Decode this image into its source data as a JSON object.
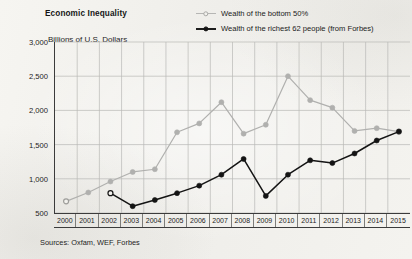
{
  "chart_data": {
    "type": "line",
    "title": "Economic Inequality",
    "subtitle": "",
    "ylabel": "Billions of U.S. Dollars",
    "xlabel": "",
    "ylim": [
      500,
      3000
    ],
    "ytick_step": 500,
    "ytick_labels": [
      "3,000",
      "2,500",
      "2,000",
      "1,500",
      "1,000",
      "500"
    ],
    "ytick_values": [
      3000,
      2500,
      2000,
      1500,
      1000,
      500
    ],
    "grid": true,
    "legend_position": "top-right",
    "categories": [
      "2000",
      "2001",
      "2002",
      "2003",
      "2004",
      "2005",
      "2006",
      "2007",
      "2008",
      "2009",
      "2010",
      "2011",
      "2012",
      "2013",
      "2014",
      "2015"
    ],
    "x": [
      2000,
      2001,
      2002,
      2003,
      2004,
      2005,
      2006,
      2007,
      2008,
      2009,
      2010,
      2011,
      2012,
      2013,
      2014,
      2015
    ],
    "series": [
      {
        "name": "Wealth of the bottom 50%",
        "color": "#b0b0ae",
        "marker": "circle-open",
        "values": [
          670,
          800,
          960,
          1100,
          1140,
          1680,
          1810,
          2120,
          1660,
          1790,
          2500,
          2150,
          2040,
          1700,
          1740,
          1690
        ]
      },
      {
        "name": "Wealth of the richest 62 people (from Forbes)",
        "color": "#141414",
        "marker": "circle-filled",
        "values": [
          null,
          null,
          790,
          600,
          690,
          790,
          900,
          1060,
          1290,
          750,
          1060,
          1270,
          1230,
          1370,
          1560,
          1690
        ]
      }
    ],
    "source_note": "Sources: Oxfam, WEF, Forbes"
  },
  "legend": {
    "items": [
      {
        "label": "Wealth of the bottom 50%"
      },
      {
        "label": "Wealth of the richest 62 people (from Forbes)"
      }
    ]
  }
}
